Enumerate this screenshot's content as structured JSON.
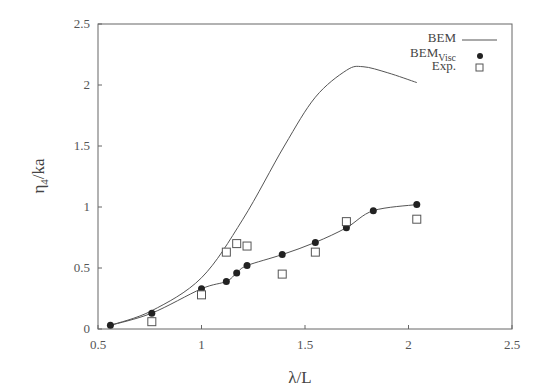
{
  "chart_data": {
    "type": "line",
    "title": "",
    "xlabel": "λ/L",
    "ylabel": "η4/ka",
    "xlim": [
      0.5,
      2.5
    ],
    "ylim": [
      0,
      2.5
    ],
    "xticks": [
      "0.5",
      "1",
      "1.5",
      "2",
      "2.5"
    ],
    "yticks": [
      "0",
      "0.5",
      "1",
      "1.5",
      "2",
      "2.5"
    ],
    "grid": false,
    "legend_position": "upper right",
    "series": [
      {
        "name": "BEM",
        "style": "line",
        "x": [
          0.56,
          0.76,
          1.0,
          1.2,
          1.4,
          1.55,
          1.7,
          1.78,
          1.9,
          2.04
        ],
        "y": [
          0.03,
          0.15,
          0.42,
          0.9,
          1.5,
          1.9,
          2.12,
          2.15,
          2.1,
          2.02
        ]
      },
      {
        "name": "BEM_Visc",
        "style": "line+filled-circle",
        "x": [
          0.56,
          0.76,
          1.0,
          1.12,
          1.17,
          1.22,
          1.39,
          1.55,
          1.7,
          1.83,
          2.04
        ],
        "y": [
          0.03,
          0.13,
          0.33,
          0.39,
          0.46,
          0.52,
          0.61,
          0.71,
          0.83,
          0.97,
          1.02
        ]
      },
      {
        "name": "Exp.",
        "style": "open-square",
        "x": [
          0.76,
          1.0,
          1.12,
          1.17,
          1.22,
          1.39,
          1.55,
          1.7,
          2.04
        ],
        "y": [
          0.06,
          0.28,
          0.63,
          0.7,
          0.68,
          0.45,
          0.63,
          0.88,
          0.9
        ]
      }
    ]
  },
  "labels": {
    "xlabel": "λ/L",
    "ylabel_main": "η",
    "ylabel_sub": "4",
    "ylabel_rest": "/ka",
    "legend_bem": "BEM",
    "legend_visc_main": "BEM",
    "legend_visc_sub": "Visc",
    "legend_exp": "Exp."
  }
}
